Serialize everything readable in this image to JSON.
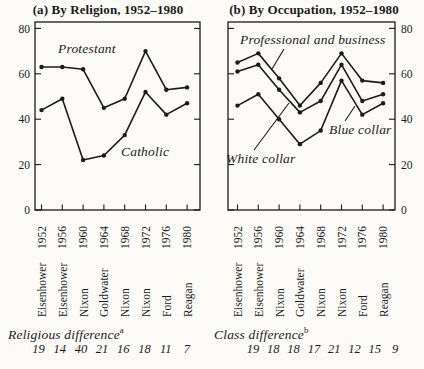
{
  "figure": {
    "paper_color": "#fcfbf8",
    "ink_color": "#1b1b1b"
  },
  "chart_data": [
    {
      "type": "line",
      "title": "(a) By Religion, 1952–1980",
      "y_axis_side": "left",
      "ylim": [
        0,
        80
      ],
      "yticks": [
        0,
        20,
        40,
        60,
        80
      ],
      "grid": false,
      "years": [
        "1952",
        "1956",
        "1960",
        "1964",
        "1968",
        "1972",
        "1976",
        "1980"
      ],
      "candidates": [
        "Eisenhower",
        "Eisenhower",
        "Nixon",
        "Goldwater",
        "Nixon",
        "Nixon",
        "Ford",
        "Reagan"
      ],
      "series": [
        {
          "name": "Protestant",
          "values": [
            63,
            63,
            62,
            45,
            49,
            70,
            53,
            54
          ]
        },
        {
          "name": "Catholic",
          "values": [
            44,
            49,
            22,
            24,
            33,
            52,
            42,
            47
          ]
        }
      ],
      "difference": {
        "label": "Religious difference",
        "note": "a",
        "values": [
          "19",
          "14",
          "40",
          "21",
          "16",
          "18",
          "11",
          "7"
        ]
      }
    },
    {
      "type": "line",
      "title": "(b) By Occupation, 1952–1980",
      "y_axis_side": "right",
      "ylim": [
        0,
        80
      ],
      "yticks": [
        0,
        20,
        40,
        60,
        80
      ],
      "grid": false,
      "years": [
        "1952",
        "1956",
        "1960",
        "1964",
        "1968",
        "1972",
        "1976",
        "1980"
      ],
      "candidates": [
        "Eisenhower",
        "Eisenhower",
        "Nixon",
        "Goldwater",
        "Nixon",
        "Nixon",
        "Ford",
        "Reagan"
      ],
      "series": [
        {
          "name": "Professional and business",
          "values": [
            65,
            69,
            58,
            46,
            56,
            69,
            57,
            56
          ]
        },
        {
          "name": "White collar",
          "values": [
            61,
            64,
            53,
            43,
            48,
            64,
            48,
            51
          ]
        },
        {
          "name": "Blue collar",
          "values": [
            46,
            51,
            40,
            29,
            35,
            57,
            42,
            47
          ]
        }
      ],
      "difference": {
        "label": "Class difference",
        "note": "b",
        "values": [
          "19",
          "18",
          "18",
          "17",
          "21",
          "12",
          "15",
          "9"
        ]
      }
    }
  ]
}
